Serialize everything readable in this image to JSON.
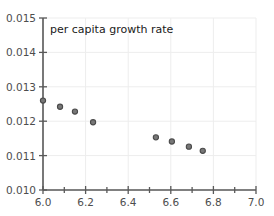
{
  "chart_data": {
    "type": "scatter",
    "title": "per capita growth rate",
    "xlabel": "",
    "ylabel": "",
    "xlim": [
      6.0,
      7.0
    ],
    "ylim": [
      0.01,
      0.015
    ],
    "grid": true,
    "legend": null,
    "x_ticks": [
      6.0,
      6.2,
      6.4,
      6.6,
      6.8,
      7.0
    ],
    "x_tick_labels": [
      "6.0",
      "6.2",
      "6.4",
      "6.6",
      "6.8",
      "7.0"
    ],
    "x_minor_ticks": [
      6.1,
      6.3,
      6.5,
      6.7,
      6.9
    ],
    "y_ticks": [
      0.01,
      0.011,
      0.012,
      0.013,
      0.014,
      0.015
    ],
    "y_tick_labels": [
      "0.010",
      "0.011",
      "0.012",
      "0.013",
      "0.014",
      "0.015"
    ],
    "marker": {
      "shape": "circle",
      "fill_color": "#777777",
      "edge_color": "#4a4a4a",
      "size_px": 5.2
    },
    "points": [
      {
        "x": 6.0,
        "y": 0.0126
      },
      {
        "x": 6.08,
        "y": 0.01242
      },
      {
        "x": 6.15,
        "y": 0.01228
      },
      {
        "x": 6.235,
        "y": 0.01197
      },
      {
        "x": 6.53,
        "y": 0.01153
      },
      {
        "x": 6.605,
        "y": 0.01141
      },
      {
        "x": 6.685,
        "y": 0.01126
      },
      {
        "x": 6.75,
        "y": 0.01114
      }
    ],
    "series": [
      {
        "name": "per capita growth rate",
        "x": [
          6.0,
          6.08,
          6.15,
          6.235,
          6.53,
          6.605,
          6.685,
          6.75
        ],
        "values": [
          0.0126,
          0.01242,
          0.01228,
          0.01197,
          0.01153,
          0.01141,
          0.01126,
          0.01114
        ]
      }
    ]
  },
  "axes": {
    "y_labels": {
      "t0": "0.010",
      "t1": "0.011",
      "t2": "0.012",
      "t3": "0.013",
      "t4": "0.014",
      "t5": "0.015"
    },
    "x_labels": {
      "t0": "6.0",
      "t1": "6.2",
      "t2": "6.4",
      "t3": "6.6",
      "t4": "6.8",
      "t5": "7.0"
    }
  },
  "title_text": "per capita growth rate"
}
